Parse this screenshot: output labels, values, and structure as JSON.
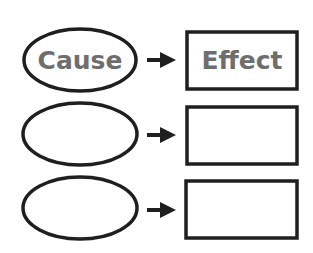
{
  "diagram": {
    "rows": [
      {
        "cause": "Cause",
        "effect": "Effect"
      },
      {
        "cause": "",
        "effect": ""
      },
      {
        "cause": "",
        "effect": ""
      }
    ],
    "colors": {
      "stroke": "#1f1f1f",
      "text": "#6e6e6e",
      "background": "#ffffff"
    }
  }
}
